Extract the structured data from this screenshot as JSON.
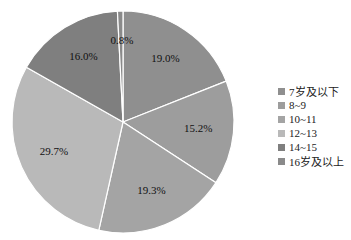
{
  "chart_data": {
    "type": "pie",
    "title": "",
    "categories": [
      "7岁及以下",
      "8~9",
      "10~11",
      "12~13",
      "14~15",
      "16岁及以上"
    ],
    "values": [
      19.0,
      15.2,
      19.3,
      29.7,
      16.0,
      0.8
    ],
    "value_labels": [
      "19.0%",
      "15.2%",
      "19.3%",
      "29.7%",
      "16.0%",
      "0.8%"
    ],
    "colors": [
      "#8f8f8f",
      "#9d9d9d",
      "#a4a4a4",
      "#b9b9b9",
      "#7f7f7f",
      "#8a8a8a"
    ],
    "start_angle": "top (12 o'clock), clockwise",
    "legend_position": "right"
  },
  "legend": {
    "items": [
      {
        "label": "7岁及以下",
        "color": "#8f8f8f"
      },
      {
        "label": "8~9",
        "color": "#9d9d9d"
      },
      {
        "label": "10~11",
        "color": "#a4a4a4"
      },
      {
        "label": "12~13",
        "color": "#b9b9b9"
      },
      {
        "label": "14~15",
        "color": "#7f7f7f"
      },
      {
        "label": "16岁及以上",
        "color": "#8a8a8a"
      }
    ]
  }
}
